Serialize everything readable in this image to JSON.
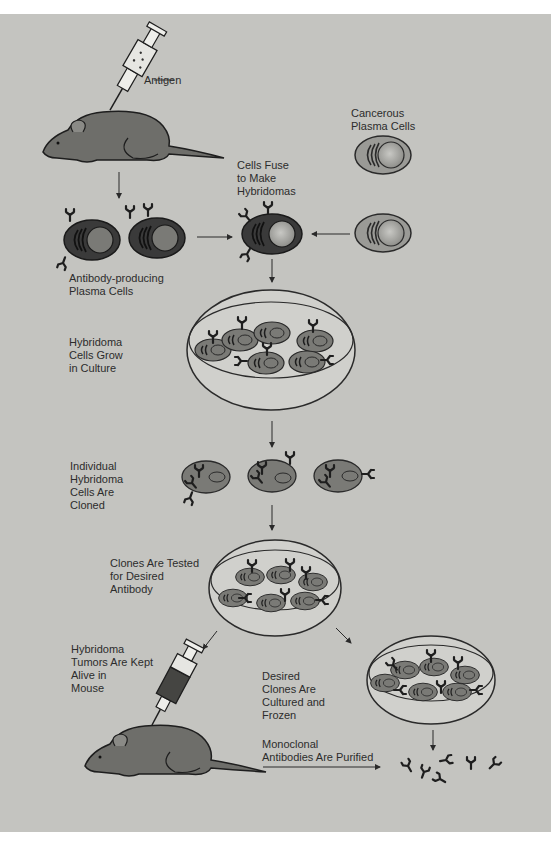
{
  "diagram": {
    "colors": {
      "background": "#c4c4c0",
      "margin": "#ffffff",
      "ink": "#1e1e1e",
      "cell_dark": "#3a3a3a",
      "cell_medium": "#7a7a76",
      "cell_light": "#a8a8a4",
      "dish_fill": "#d2d2ce"
    },
    "labels": {
      "antigen": "Antigen",
      "cancerous_plasma_cells": "Cancerous\nPlasma Cells",
      "cells_fuse": "Cells Fuse\nto Make\nHybridomas",
      "antibody_producing": "Antibody-producing\nPlasma Cells",
      "hybridoma_grow": "Hybridoma\nCells Grow\nin Culture",
      "individual_cloned": "Individual\nHybridoma\nCells Are\nCloned",
      "clones_tested": "Clones Are Tested\nfor Desired\nAntibody",
      "tumors_kept": "Hybridoma\nTumors Are Kept\nAlive in\nMouse",
      "desired_clones": "Desired\nClones Are\nCultured and\nFrozen",
      "purified": "Monoclonal\nAntibodies Are Purified"
    },
    "nodes": [
      {
        "id": "mouse-1",
        "type": "mouse-with-syringe",
        "syringe_content": "antigen"
      },
      {
        "id": "plasma-cells",
        "type": "cell-pair",
        "count": 2
      },
      {
        "id": "cancer-cells",
        "type": "cell",
        "count": 2
      },
      {
        "id": "hybridoma",
        "type": "fused-cell"
      },
      {
        "id": "culture-dish",
        "type": "petri-dish",
        "cell_count": 6
      },
      {
        "id": "clones",
        "type": "cell-row",
        "count": 3
      },
      {
        "id": "test-dish",
        "type": "petri-dish",
        "cell_count": 6
      },
      {
        "id": "mouse-2",
        "type": "mouse-with-syringe",
        "syringe_content": "hybridoma"
      },
      {
        "id": "frozen-dish",
        "type": "petri-dish",
        "cell_count": 6
      },
      {
        "id": "antibodies",
        "type": "antibody-cluster",
        "count": 6
      }
    ]
  }
}
